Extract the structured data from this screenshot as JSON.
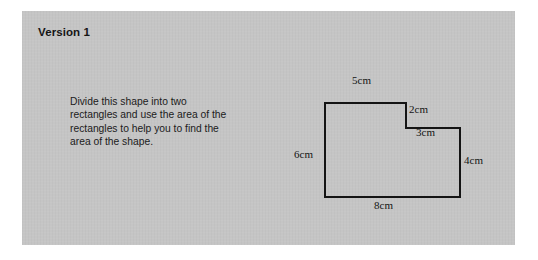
{
  "page": {
    "background_color": "#ffffff",
    "panel_color": "#c5c5c5",
    "ink_color": "#141414"
  },
  "header": {
    "title": "Version 1"
  },
  "instruction": {
    "lines": [
      "Divide this shape into two",
      "rectangles and use the area of the",
      "rectangles to help you to find the",
      "area of the shape."
    ],
    "full_text": "Divide this shape into two rectangles and use the area of the rectangles to help you to find the area of the shape."
  },
  "figure": {
    "shape_name": "l-shaped-polygon",
    "stroke_color": "#141414",
    "fill": "none",
    "vertices": [
      [
        55,
        37
      ],
      [
        136,
        37
      ],
      [
        136,
        62
      ],
      [
        190,
        62
      ],
      [
        190,
        131
      ],
      [
        55,
        131
      ]
    ],
    "labels": {
      "top": "5cm",
      "step_vertical": "2cm",
      "step_horizontal": "3cm",
      "right": "4cm",
      "bottom": "8cm",
      "left": "6cm"
    }
  }
}
